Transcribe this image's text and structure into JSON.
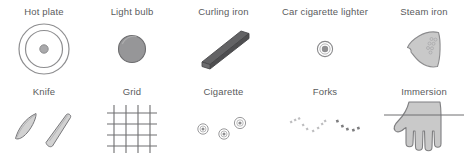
{
  "figure": {
    "background_color": "#ffffff",
    "label_color": "#5a5b5d",
    "rows": [
      {
        "name": "top-row",
        "cells": [
          {
            "label": "Hot plate",
            "icon": "hot-plate-icon"
          },
          {
            "label": "Light bulb",
            "icon": "light-bulb-icon"
          },
          {
            "label": "Curling iron",
            "icon": "curling-iron-icon"
          },
          {
            "label": "Car cigarette lighter",
            "icon": "car-cigarette-lighter-icon"
          },
          {
            "label": "Steam iron",
            "icon": "steam-iron-icon"
          }
        ]
      },
      {
        "name": "bottom-row",
        "cells": [
          {
            "label": "Knife",
            "icon": "knife-icon"
          },
          {
            "label": "Grid",
            "icon": "grid-icon"
          },
          {
            "label": "Cigarette",
            "icon": "cigarette-icon"
          },
          {
            "label": "Forks",
            "icon": "forks-icon"
          },
          {
            "label": "Immersion",
            "icon": "immersion-icon"
          }
        ]
      }
    ]
  },
  "palette": {
    "outline": "#8a8a8c",
    "outline_dark": "#4f4f51",
    "fill_light": "#cfcfcf",
    "fill_mid": "#9b9b9b",
    "fill_dark": "#58585a",
    "grid_line": "#6e6e70",
    "label": "#5a5b5d",
    "background": "#ffffff"
  }
}
